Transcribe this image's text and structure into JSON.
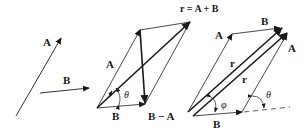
{
  "figure": {
    "panel_left": {
      "vector_a_label": "A",
      "vector_b_label": "B"
    },
    "panel_middle": {
      "resultant_label": "r = A + B",
      "vector_a_label": "A",
      "vector_b_label": "B",
      "difference_label": "B − A",
      "angle_label": "θ"
    },
    "panel_right": {
      "vector_a_top_label": "A",
      "vector_a_right_label": "A",
      "vector_b_top_label": "B",
      "vector_b_bottom_label": "B",
      "resultant_label_1": "r",
      "resultant_label_2": "r",
      "angle_phi_label": "φ",
      "angle_theta_label": "θ"
    },
    "colors": {
      "ink": "#1a1a1a",
      "background": "#ffffff"
    }
  }
}
